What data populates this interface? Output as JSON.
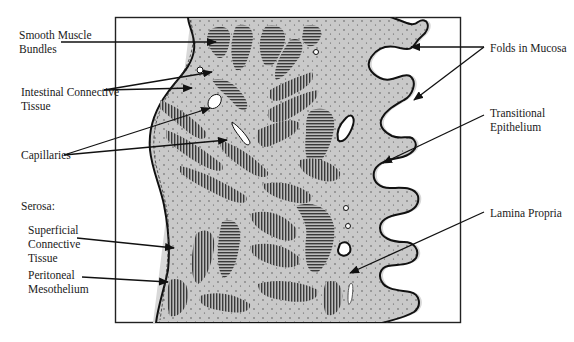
{
  "labels": {
    "smooth_muscle": "Smooth Muscle\nBundles",
    "intestinal_ct": "Intestinal Connective\nTissue",
    "capillaries": "Capillaries",
    "serosa": "Serosa:",
    "superficial_ct": "Superficial\nConnective\nTissue",
    "peritoneal": "Peritoneal\nMesothelium",
    "folds": "Folds in Mucosa",
    "transitional": "Transitional\nEpithelium",
    "lamina": "Lamina Propria"
  },
  "colors": {
    "tissue": "#c8c8c8",
    "muscle": "#555555",
    "outline": "#111111",
    "halo": "#d8d8d8"
  }
}
